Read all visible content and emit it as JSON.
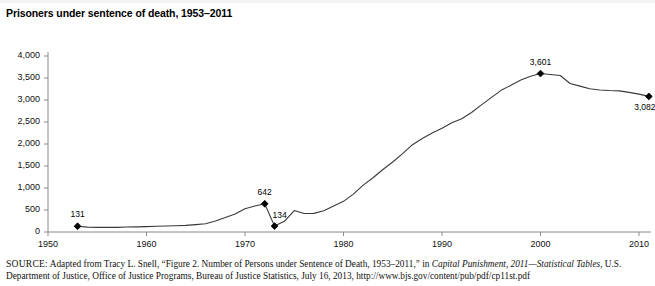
{
  "figure": {
    "title": "Prisoners under sentence of death, 1953–2011",
    "source_prefix": "SOURCE:",
    "source_part1": " Adapted from Tracy L. Snell, “Figure 2. Number of Persons under Sentence of Death, 1953–2011,” in ",
    "source_italic1": "Capital Punishment, 2011—Statistical Tables",
    "source_part2": ", U.S. Department of Justice, Office of Justice Programs, Bureau of Justice Statistics, July 16, 2013, http://www.bjs.gov/content/pub/pdf/cp11st.pdf"
  },
  "chart_data": {
    "type": "line",
    "title": "Prisoners under sentence of death, 1953–2011",
    "xlabel": "",
    "ylabel": "",
    "xlim": [
      1950,
      2010
    ],
    "ylim": [
      0,
      4000
    ],
    "grid": false,
    "legend": "none",
    "line_color": "#3a3a3a",
    "marker_color": "#000000",
    "xticks": [
      1950,
      1960,
      1970,
      1980,
      1990,
      2000,
      2010
    ],
    "xtick_labels": [
      "1950",
      "1960",
      "1970",
      "1980",
      "1990",
      "2000",
      "2010"
    ],
    "yticks": [
      0,
      500,
      1000,
      1500,
      2000,
      2500,
      3000,
      3500,
      4000
    ],
    "ytick_labels": [
      "0",
      "500",
      "1,000",
      "1,500",
      "2,000",
      "2,500",
      "3,000",
      "3,500",
      "4,000"
    ],
    "annotations": [
      {
        "x": 1953,
        "y": 131,
        "label": "131",
        "position": "above"
      },
      {
        "x": 1972,
        "y": 642,
        "label": "642",
        "position": "above"
      },
      {
        "x": 1973,
        "y": 134,
        "label": "134",
        "position": "above-right"
      },
      {
        "x": 2000,
        "y": 3601,
        "label": "3,601",
        "position": "above"
      },
      {
        "x": 2011,
        "y": 3082,
        "label": "3,082",
        "position": "below-right"
      }
    ],
    "x": [
      1953,
      1954,
      1955,
      1956,
      1957,
      1958,
      1959,
      1960,
      1961,
      1962,
      1963,
      1964,
      1965,
      1966,
      1967,
      1968,
      1969,
      1970,
      1971,
      1972,
      1973,
      1974,
      1975,
      1976,
      1977,
      1978,
      1979,
      1980,
      1981,
      1982,
      1983,
      1984,
      1985,
      1986,
      1987,
      1988,
      1989,
      1990,
      1991,
      1992,
      1993,
      1994,
      1995,
      1996,
      1997,
      1998,
      1999,
      2000,
      2001,
      2002,
      2003,
      2004,
      2005,
      2006,
      2007,
      2008,
      2009,
      2010,
      2011
    ],
    "values": [
      131,
      110,
      104,
      104,
      105,
      113,
      117,
      122,
      129,
      136,
      143,
      150,
      168,
      186,
      250,
      330,
      410,
      530,
      590,
      642,
      134,
      244,
      488,
      420,
      423,
      482,
      593,
      697,
      860,
      1066,
      1232,
      1420,
      1591,
      1781,
      1984,
      2124,
      2250,
      2356,
      2482,
      2575,
      2716,
      2890,
      3054,
      3219,
      3335,
      3452,
      3540,
      3601,
      3581,
      3557,
      3374,
      3315,
      3254,
      3228,
      3215,
      3207,
      3173,
      3134,
      3082
    ]
  }
}
